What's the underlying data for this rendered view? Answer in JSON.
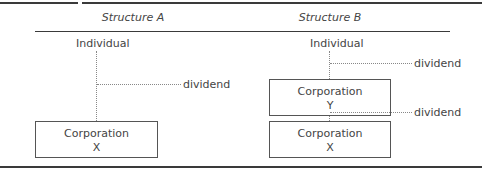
{
  "structure_a": {
    "title": "Structure A",
    "individual": "Individual",
    "dividend": "dividend",
    "corp_x": {
      "line1": "Corporation",
      "line2": "X"
    }
  },
  "structure_b": {
    "title": "Structure B",
    "individual": "Individual",
    "dividend_top": "dividend",
    "corp_y": {
      "line1": "Corporation",
      "line2": "Y"
    },
    "dividend_bottom": "dividend",
    "corp_x": {
      "line1": "Corporation",
      "line2": "X"
    }
  },
  "colors": {
    "line": "#3a3a3a",
    "text": "#444444",
    "dotted": "#888888"
  }
}
